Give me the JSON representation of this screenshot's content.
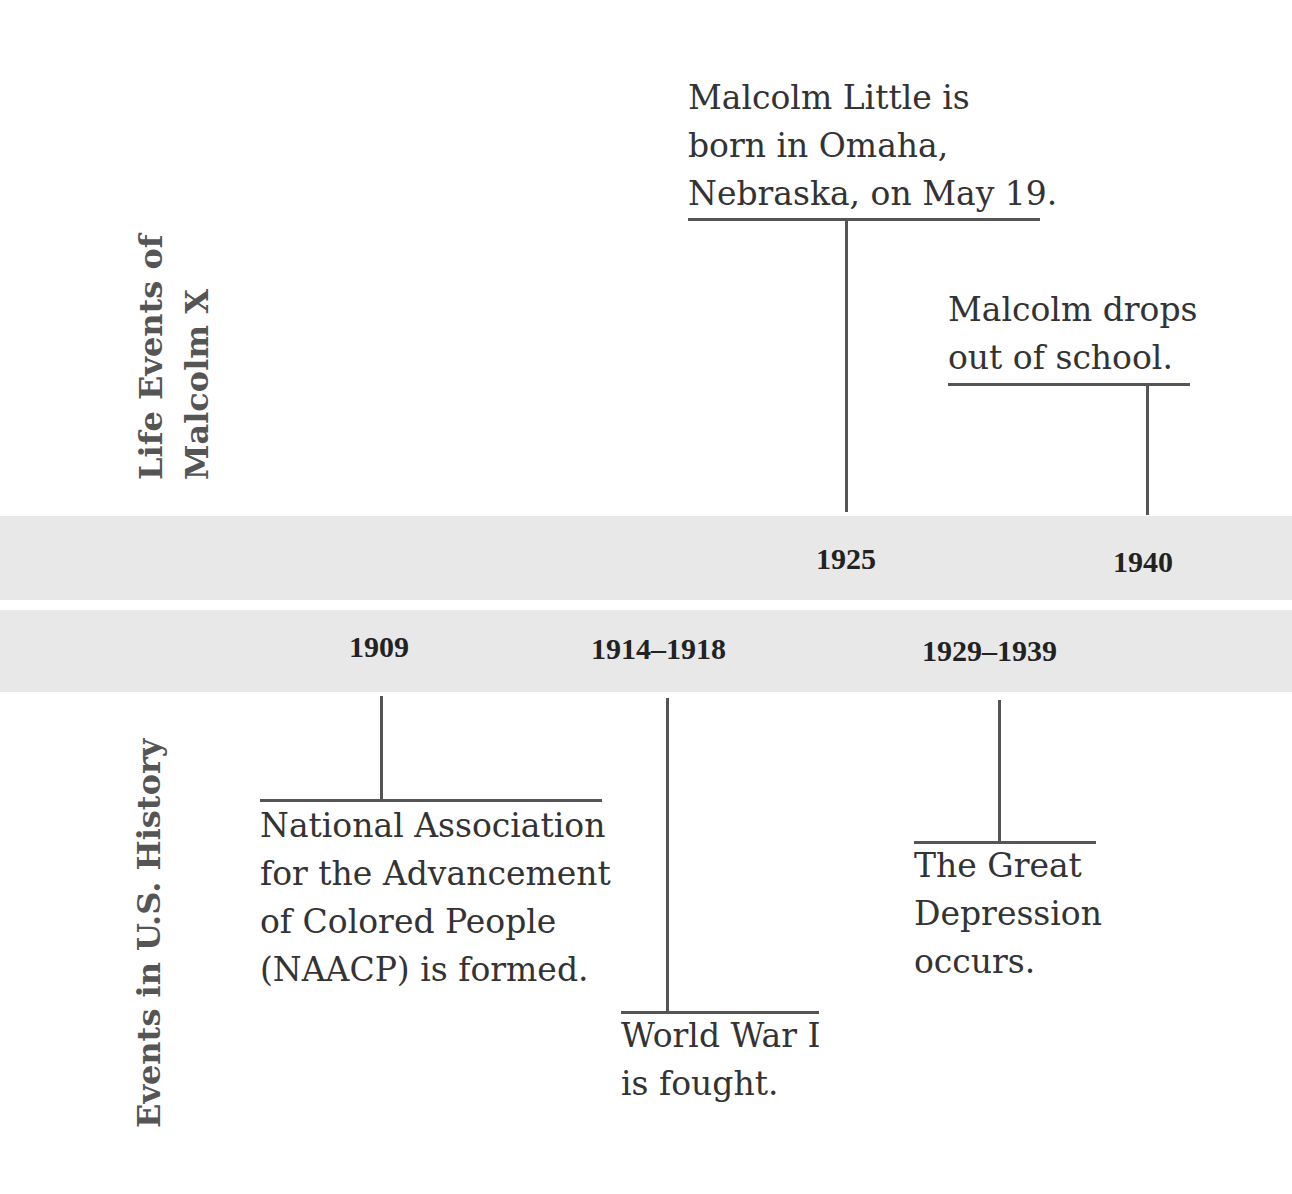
{
  "labels": {
    "top_section_line1": "Life Events of",
    "top_section_line2": "Malcolm X",
    "bottom_section": "Events in U.S. History"
  },
  "malcolm_events": [
    {
      "year": "1925",
      "text_lines": [
        "Malcolm Little is",
        "born in Omaha,",
        "Nebraska, on May 19."
      ]
    },
    {
      "year": "1940",
      "text_lines": [
        "Malcolm drops",
        "out of school."
      ]
    }
  ],
  "us_events": [
    {
      "year": "1909",
      "text_lines": [
        "National Association",
        "for the Advancement",
        "of Colored People",
        "(NAACP) is formed."
      ]
    },
    {
      "year": "1914–1918",
      "text_lines": [
        "World War I",
        "is fought."
      ]
    },
    {
      "year": "1929–1939",
      "text_lines": [
        "The Great",
        "Depression",
        "occurs."
      ]
    }
  ],
  "colors": {
    "band": "#e8e8e8",
    "line": "#555555",
    "text": "#333333"
  }
}
